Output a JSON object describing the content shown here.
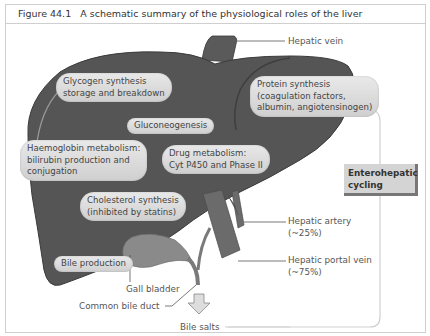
{
  "figure": {
    "number": "Figure 44.1",
    "title": "A schematic summary of the physiological roles of the liver"
  },
  "roles": {
    "glycogen": [
      "Glycogen synthesis",
      "storage and breakdown"
    ],
    "protein": [
      "Protein synthesis",
      "(coagulation factors,",
      "albumin, angiotensinogen)"
    ],
    "gluconeogenesis": "Gluconeogenesis",
    "haemoglobin": [
      "Haemoglobin metabolism:",
      "bilirubin production and",
      "conjugation"
    ],
    "drug": [
      "Drug metabolism:",
      "Cyt P450 and Phase II"
    ],
    "cholesterol": [
      "Cholesterol synthesis",
      "(inhibited by statins)"
    ],
    "bile": "Bile production"
  },
  "labels": {
    "hepatic_vein": "Hepatic vein",
    "hepatic_artery": [
      "Hepatic artery",
      "(~25%)"
    ],
    "hepatic_portal_vein": [
      "Hepatic portal vein",
      "(~75%)"
    ],
    "gall_bladder": "Gall bladder",
    "common_bile_duct": "Common bile duct",
    "bile_salts": "Bile salts",
    "enterohepatic": [
      "Enterohepatic",
      "cycling"
    ]
  },
  "colors": {
    "liver": "#555555",
    "liver_outline": "#3a3a3a",
    "vessel": "#6b6b6b",
    "gall_bladder": "#8a8a8a",
    "bubble": "#dcdcdc",
    "line": "#555555",
    "cycle_line": "#c8c8c8"
  }
}
